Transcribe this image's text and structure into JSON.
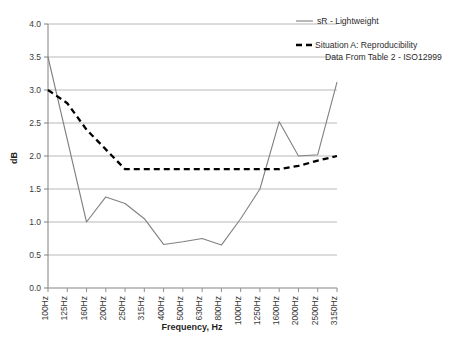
{
  "chart_data": {
    "type": "line",
    "title": "",
    "xlabel": "Frequency, Hz",
    "ylabel": "dB",
    "ylim": [
      0.0,
      4.0
    ],
    "ytick_step": 0.5,
    "grid": "horizontal",
    "legend_position": "top-right",
    "categories": [
      "100Hz",
      "125Hz",
      "160Hz",
      "200Hz",
      "250Hz",
      "315Hz",
      "400Hz",
      "500Hz",
      "630Hz",
      "800Hz",
      "1000Hz",
      "1250Hz",
      "1600Hz",
      "2000Hz",
      "2500Hz",
      "3150Hz"
    ],
    "yticks": [
      "0.0",
      "0.5",
      "1.0",
      "1.5",
      "2.0",
      "2.5",
      "3.0",
      "3.5",
      "4.0"
    ],
    "series": [
      {
        "name": "sR - Lightweight",
        "style": "solid",
        "color": "#808080",
        "values": [
          3.5,
          2.25,
          1.0,
          1.38,
          1.28,
          1.05,
          0.66,
          0.7,
          0.75,
          0.65,
          1.05,
          1.5,
          2.52,
          2.0,
          2.02,
          3.12
        ]
      },
      {
        "name": "Situation A: Reproducibility Data From Table 2 - ISO12999",
        "name_line1": "Situation A: Reproducibility",
        "name_line2": "Data From Table 2 - ISO12999",
        "style": "dashed",
        "color": "#000000",
        "values": [
          3.0,
          2.8,
          2.4,
          2.1,
          1.8,
          1.8,
          1.8,
          1.8,
          1.8,
          1.8,
          1.8,
          1.8,
          1.8,
          1.85,
          1.93,
          2.0
        ]
      }
    ]
  },
  "legend": {
    "entries": [
      {
        "label": "sR - Lightweight"
      },
      {
        "label_line1": "Situation A: Reproducibility",
        "label_line2": "Data From Table 2 - ISO12999"
      }
    ]
  },
  "colors": {
    "series_solid": "#808080",
    "series_dashed": "#000000",
    "gridline": "#a6a6a6",
    "axis": "#808080",
    "text": "#2b2b2b",
    "background": "#ffffff"
  }
}
